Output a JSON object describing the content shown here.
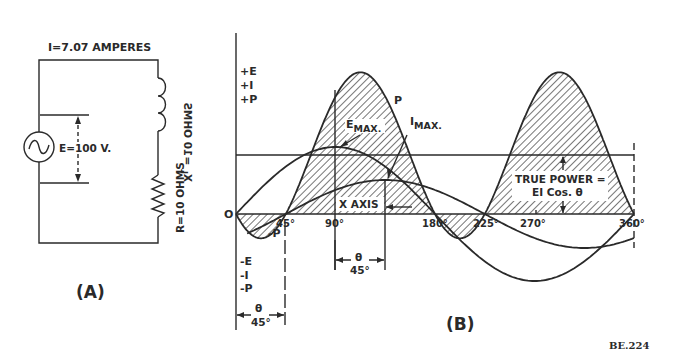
{
  "figure_id": "BE.224",
  "panel_a": {
    "label": "(A)",
    "current_label": "I=7.07 AMPERES",
    "voltage_label": "E=100 V.",
    "inductor_label": "X",
    "inductor_sub": "L",
    "inductor_value": " =10 OHMS",
    "resistor_label": "R=10 OHMS",
    "source_icon": "ac-source-icon"
  },
  "panel_b": {
    "label": "(B)",
    "positive_labels": [
      "+E",
      "+I",
      "+P"
    ],
    "negative_labels": [
      "-E",
      "-I",
      "-P"
    ],
    "negative_p_label": "-P",
    "origin_label": "O",
    "x_ticks": [
      "45°",
      "90°",
      "180°",
      "225°",
      "270°",
      "360°"
    ],
    "p_label": "P",
    "e_max_label": "E",
    "e_max_sub": "MAX.",
    "i_max_label": "I",
    "i_max_sub": "MAX.",
    "x_axis_label": "X AXIS",
    "true_power_line1": "TRUE POWER =",
    "true_power_line2": "EI Cos. θ",
    "theta_symbol": "θ",
    "theta_value": "45°"
  },
  "chart_data": {
    "type": "line",
    "title": "",
    "xlabel": "X AXIS (degrees)",
    "ylabel": "+E / +I / +P",
    "x": [
      0,
      45,
      90,
      135,
      180,
      225,
      270,
      315,
      360
    ],
    "series": [
      {
        "name": "E (voltage)",
        "values": [
          0,
          0.707,
          1,
          0.707,
          0,
          -0.707,
          -1,
          -0.707,
          0
        ]
      },
      {
        "name": "I (current, lags 45°)",
        "values": [
          -0.707,
          0,
          0.707,
          1,
          0.707,
          0,
          -0.707,
          -1,
          -0.707
        ]
      },
      {
        "name": "P (power = E×I)",
        "values": [
          0,
          0,
          0.707,
          0.707,
          0,
          0,
          0.707,
          0.707,
          0
        ]
      }
    ],
    "annotations": [
      "EMAX.",
      "IMAX.",
      "P",
      "-P",
      "TRUE POWER = EI Cos. θ",
      "θ 45°"
    ],
    "phase_angle_deg": 45,
    "grid": false
  }
}
